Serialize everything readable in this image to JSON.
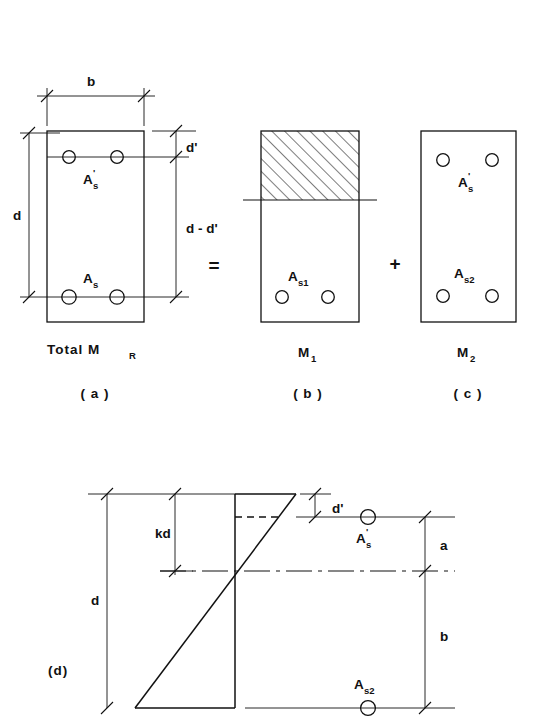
{
  "figure": {
    "kind": "engineering-diagram",
    "stroke_color": "#111111",
    "background_color": "#ffffff"
  },
  "operators": {
    "equals": "=",
    "plus": "+"
  },
  "panel_a": {
    "caption_moment": "Total  M",
    "caption_moment_sub": "R",
    "caption_index": "( a )",
    "dim_width": "b",
    "dim_depth": "d",
    "dim_cover": "d'",
    "dim_lever": "d - d'",
    "bars_top_label": "A",
    "bars_top_label_sub": "s",
    "bars_top_label_prime": "'",
    "bars_bottom_label": "A",
    "bars_bottom_label_sub": "s"
  },
  "panel_b": {
    "caption_moment": "M",
    "caption_moment_sub": "1",
    "caption_index": "( b )",
    "bars_label": "A",
    "bars_label_sub": "s1",
    "hatch_note": "compression-block-hatching"
  },
  "panel_c": {
    "caption_moment": "M",
    "caption_moment_sub": "2",
    "caption_index": "( c )",
    "bars_top_label": "A",
    "bars_top_label_sub": "s",
    "bars_top_label_prime": "'",
    "bars_bottom_label": "A",
    "bars_bottom_label_sub": "s2"
  },
  "panel_d": {
    "caption_index": "(d)",
    "dim_depth": "d",
    "dim_neutral_axis": "kd",
    "dim_cover": "d'",
    "dim_upper": "a",
    "dim_lower": "b",
    "bars_top_label": "A",
    "bars_top_label_sub": "s",
    "bars_top_label_prime": "'",
    "bars_bottom_label": "A",
    "bars_bottom_label_sub": "s2"
  }
}
